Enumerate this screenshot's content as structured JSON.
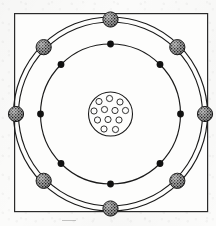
{
  "figure": {
    "kind": "bohr-atomic-model-diagram",
    "caption": "",
    "frame": {
      "x": 14,
      "y": 13,
      "width": 193,
      "height": 198,
      "stroke": "#2b2b2b",
      "stroke_width": 1.2,
      "fill": "#fdfdfc"
    },
    "background_color": "#fbfbfa",
    "ink_color": "#1a1a1a",
    "center": {
      "x": 110.5,
      "y": 114
    }
  },
  "nucleus": {
    "label": "nucleus",
    "radius": 22,
    "stroke": "#1a1a1a",
    "stroke_width": 1.1,
    "fill": "#fdfdfc",
    "particle_count": 12,
    "particle_radius": 3.1,
    "particle_stroke": "#1a1a1a",
    "particle_fill": "#fdfdfc",
    "particles": [
      {
        "dx": -11.5,
        "dy": -12.5
      },
      {
        "dx": -1.0,
        "dy": -15.5
      },
      {
        "dx": 9.5,
        "dy": -12.0
      },
      {
        "dx": -16.5,
        "dy": -3.0
      },
      {
        "dx": -6.0,
        "dy": -4.5
      },
      {
        "dx": 4.5,
        "dy": -3.5
      },
      {
        "dx": 15.0,
        "dy": -3.5
      },
      {
        "dx": -13.0,
        "dy": 6.0
      },
      {
        "dx": -2.5,
        "dy": 5.5
      },
      {
        "dx": 8.5,
        "dy": 6.0
      },
      {
        "dx": -6.5,
        "dy": 15.0
      },
      {
        "dx": 5.0,
        "dy": 15.5
      }
    ]
  },
  "orbits": [
    {
      "name": "inner-orbit",
      "radius": 70,
      "stroke": "#1a1a1a",
      "stroke_width": 1.15,
      "fill": "none",
      "electron_type": "solid-dot",
      "electron_count": 8,
      "electron_radius": 3.4,
      "electron_fill": "#111111",
      "angles_deg": [
        270,
        315,
        0,
        45,
        90,
        135,
        180,
        225
      ]
    },
    {
      "name": "outer-orbit-inner-line",
      "radius": 92,
      "stroke": "#1a1a1a",
      "stroke_width": 1.15,
      "fill": "none",
      "electron_type": "none",
      "electron_count": 0,
      "electron_radius": 0,
      "electron_fill": "none",
      "angles_deg": []
    },
    {
      "name": "outer-orbit-outer-line",
      "radius": 97,
      "stroke": "#1a1a1a",
      "stroke_width": 1.15,
      "fill": "none",
      "electron_type": "textured-sphere",
      "electron_count": 8,
      "electron_radius": 7.6,
      "electron_fill": "#8d8d8d",
      "angles_deg": [
        270,
        315,
        0,
        45,
        90,
        135,
        180,
        225
      ]
    }
  ],
  "outer_shell_marker": {
    "label": "shaded-electron-sphere",
    "placement_radius": 94.5,
    "radius": 7.6,
    "stroke": "#1a1a1a",
    "stroke_width": 1.0,
    "fill": "#8d8d8d",
    "hatch_color": "#141414"
  }
}
